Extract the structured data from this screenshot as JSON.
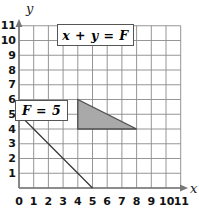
{
  "figure": {
    "type": "coordinate-grid-plot",
    "background_color": "#ffffff"
  },
  "axes": {
    "x_axis_name": "x",
    "y_axis_name": "y",
    "x_ticks": [
      "0",
      "1",
      "2",
      "3",
      "4",
      "5",
      "6",
      "7",
      "8",
      "9",
      "10",
      "11"
    ],
    "y_ticks": [
      "1",
      "2",
      "3",
      "4",
      "5",
      "6",
      "7",
      "8",
      "9",
      "10",
      "11"
    ],
    "origin_label": "0",
    "xlim": [
      0,
      11
    ],
    "ylim": [
      0,
      11
    ],
    "grid": true,
    "grid_color": "#8a8a8a",
    "axis_color": "#777777"
  },
  "labels": {
    "equation": "x + y = F",
    "f_value": "F = 5"
  },
  "chart_data": {
    "type": "line",
    "title": "",
    "xlabel": "x",
    "ylabel": "y",
    "xlim": [
      0,
      11
    ],
    "ylim": [
      0,
      11
    ],
    "grid": true,
    "annotations": [
      {
        "text": "x + y = F",
        "x": 6.5,
        "y": 10.3
      },
      {
        "text": "F = 5",
        "x": 1.1,
        "y": 5.6
      }
    ],
    "series": [
      {
        "name": "x + y = 5",
        "type": "line",
        "color": "#333333",
        "points": [
          {
            "x": 0,
            "y": 5
          },
          {
            "x": 5,
            "y": 0
          }
        ]
      },
      {
        "name": "feasible-region-triangle",
        "type": "polygon",
        "fill": "#a9a9a9",
        "stroke": "#4d4d4d",
        "points": [
          {
            "x": 4,
            "y": 6
          },
          {
            "x": 4,
            "y": 4
          },
          {
            "x": 8,
            "y": 4
          }
        ]
      }
    ]
  }
}
